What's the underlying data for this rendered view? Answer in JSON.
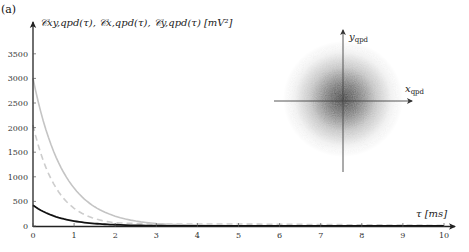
{
  "panel_label": "(a)",
  "y_axis_title": "𝒞xy,qpd(τ), 𝒞x,qpd(τ), 𝒞y,qpd(τ) [mV²]",
  "x_axis_title": "τ [ms]",
  "inset": {
    "x_label": "x_qpd",
    "y_label": "y_qpd"
  },
  "colors": {
    "axis": "#222222",
    "series_solid_gray": "#c4c4c4",
    "series_dashed_gray": "#cdcdcd",
    "series_black": "#111111"
  },
  "chart_data": {
    "type": "line",
    "title": "",
    "xlabel": "τ [ms]",
    "ylabel": "C_xy,qpd(τ), C_x,qpd(τ), C_y,qpd(τ) [mV^2]",
    "xlim": [
      0,
      10
    ],
    "ylim": [
      0,
      3800
    ],
    "x_ticks": [
      0,
      1,
      2,
      3,
      4,
      5,
      6,
      7,
      8,
      9,
      10
    ],
    "y_ticks": [
      0,
      500,
      1000,
      1500,
      2000,
      2500,
      3000,
      3500
    ],
    "grid": false,
    "legend": "none",
    "series": [
      {
        "name": "C_x,qpd(τ) (solid gray)",
        "style": "solid",
        "color": "#c4c4c4",
        "x": [
          0,
          0.5,
          1,
          1.5,
          2,
          3,
          4,
          5,
          6,
          7,
          8,
          9,
          10
        ],
        "values": [
          3000,
          1520,
          770,
          390,
          200,
          50,
          15,
          5,
          2,
          1,
          0,
          0,
          0
        ]
      },
      {
        "name": "C_y,qpd(τ) (dashed gray)",
        "style": "dashed",
        "color": "#cdcdcd",
        "x": [
          0,
          0.5,
          1,
          1.5,
          2,
          3,
          4,
          5,
          6,
          7,
          8,
          9,
          10
        ],
        "values": [
          2050,
          860,
          360,
          150,
          65,
          40,
          40,
          40,
          35,
          30,
          25,
          20,
          15
        ]
      },
      {
        "name": "C_xy,qpd(τ) (black)",
        "style": "solid",
        "color": "#111111",
        "x": [
          0,
          0.5,
          1,
          1.5,
          2,
          3,
          4,
          5,
          6,
          7,
          8,
          9,
          10
        ],
        "values": [
          420,
          205,
          100,
          50,
          25,
          6,
          2,
          0,
          0,
          0,
          0,
          0,
          0
        ]
      }
    ],
    "inset": {
      "type": "scatter-density",
      "description": "2D Gaussian scatter cloud of QPD positions centered at origin",
      "xlabel": "x_qpd",
      "ylabel": "y_qpd"
    }
  }
}
